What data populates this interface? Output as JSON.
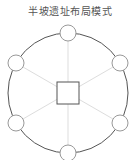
{
  "title": "半坡遗址布局模式",
  "diagram": {
    "outer_ring": {
      "cx": 68,
      "cy": 93,
      "r": 60,
      "stroke": "#555555"
    },
    "center_square": {
      "cx": 68,
      "cy": 93,
      "size": 22,
      "stroke": "#555555"
    },
    "node_radius": 8,
    "node_stroke": "#999999",
    "spoke_color": "#dddddd",
    "nodes": [
      {
        "cx": 68,
        "cy": 33
      },
      {
        "cx": 120,
        "cy": 63
      },
      {
        "cx": 120,
        "cy": 123
      },
      {
        "cx": 68,
        "cy": 153
      },
      {
        "cx": 16,
        "cy": 123
      },
      {
        "cx": 16,
        "cy": 63
      }
    ]
  }
}
